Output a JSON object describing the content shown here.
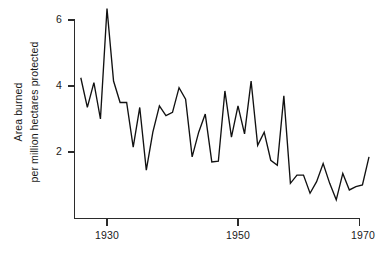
{
  "chart_data": {
    "type": "line",
    "title": "",
    "subtitle": "",
    "xlabel": "",
    "ylabel_line1": "Area burned",
    "ylabel_line2": "per million hectares protected",
    "ylabel": "Area burned per million hectares protected",
    "xlim": [
      1926,
      1970
    ],
    "ylim": [
      0,
      6.6
    ],
    "xticks": [
      1930,
      1950,
      1970
    ],
    "xticklabels": [
      "1930",
      "1950",
      "1970"
    ],
    "yticks": [
      2,
      4,
      6
    ],
    "yticklabels": [
      "2",
      "4",
      "6"
    ],
    "grid": false,
    "legend": "none",
    "line_color": "#111111",
    "axis_color": "#2b2b2b",
    "background": "#ffffff",
    "series": [
      {
        "name": "Area burned per million hectares protected",
        "x": [
          1926,
          1927,
          1928,
          1929,
          1930,
          1931,
          1932,
          1933,
          1934,
          1935,
          1936,
          1937,
          1938,
          1939,
          1940,
          1941,
          1942,
          1943,
          1944,
          1945,
          1946,
          1947,
          1948,
          1949,
          1950,
          1951,
          1952,
          1953,
          1954,
          1955,
          1956,
          1957,
          1958,
          1959,
          1960,
          1961,
          1962,
          1963,
          1964,
          1965,
          1966,
          1967,
          1968,
          1969,
          1970
        ],
        "values": [
          4.25,
          3.35,
          4.1,
          3.0,
          6.35,
          4.15,
          3.5,
          3.5,
          2.15,
          3.35,
          1.45,
          2.6,
          3.4,
          3.1,
          3.2,
          3.95,
          3.6,
          1.85,
          2.6,
          3.15,
          1.7,
          1.72,
          3.85,
          2.45,
          3.4,
          2.55,
          4.15,
          2.2,
          2.6,
          1.75,
          1.6,
          3.7,
          1.05,
          1.3,
          1.3,
          0.75,
          1.1,
          1.65,
          1.05,
          0.55,
          1.35,
          0.85,
          0.95,
          1.0,
          1.85
        ]
      }
    ]
  },
  "axis": {
    "y_label_top": "Area burned",
    "y_label_bottom": "per million hectares protected"
  }
}
